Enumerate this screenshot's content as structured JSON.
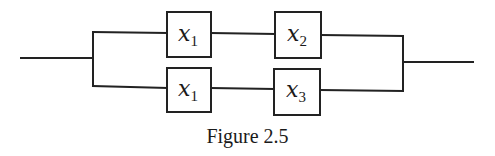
{
  "figure": {
    "caption": "Figure 2.5",
    "type": "series-parallel switching network"
  },
  "branches": [
    {
      "name": "top",
      "components": [
        {
          "var": "x",
          "sub": "1"
        },
        {
          "var": "x",
          "sub": "2"
        }
      ]
    },
    {
      "name": "bottom",
      "components": [
        {
          "var": "x",
          "sub": "1"
        },
        {
          "var": "x",
          "sub": "3"
        }
      ]
    }
  ]
}
